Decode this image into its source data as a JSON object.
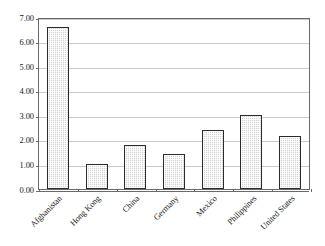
{
  "chart_data": {
    "type": "bar",
    "title": "",
    "xlabel": "",
    "ylabel": "",
    "categories": [
      "Afghanistan",
      "Hong Kong",
      "China",
      "Germany",
      "Mexico",
      "Philippines",
      "United States"
    ],
    "values": [
      6.6,
      1.0,
      1.8,
      1.43,
      2.4,
      3.02,
      2.15
    ],
    "ylim": [
      0.0,
      7.0
    ],
    "ytick_values": [
      0.0,
      1.0,
      2.0,
      3.0,
      4.0,
      5.0,
      6.0,
      7.0
    ],
    "ytick_labels": [
      "0.00",
      "1.00",
      "2.00",
      "3.00",
      "4.00",
      "5.00",
      "6.00",
      "7.00"
    ],
    "grid": true,
    "legend": false,
    "legend_position": "none",
    "xtick_rotation": -45,
    "bar_fill": "#d2d2d2",
    "bar_border": "#2b2b2b",
    "gridline_color": "#c9c9c9",
    "axis_color": "#6a6a6a",
    "text_color": "#1a1a1a",
    "background": "#ffffff"
  }
}
